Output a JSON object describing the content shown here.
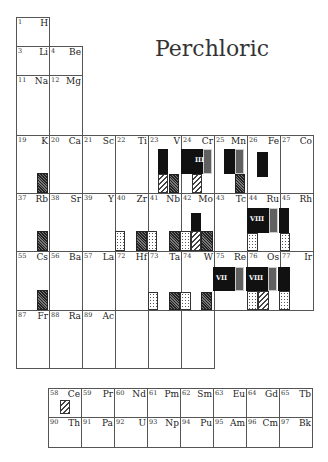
{
  "title": "Perchloric",
  "main_table": [
    {
      "n": "1",
      "s": "H"
    },
    {
      "n": "3",
      "s": "Li"
    },
    {
      "n": "4",
      "s": "Be"
    },
    {
      "n": "11",
      "s": "Na"
    },
    {
      "n": "12",
      "s": "Mg"
    },
    {
      "n": "19",
      "s": "K"
    },
    {
      "n": "20",
      "s": "Ca"
    },
    {
      "n": "21",
      "s": "Sc"
    },
    {
      "n": "22",
      "s": "Ti"
    },
    {
      "n": "23",
      "s": "V"
    },
    {
      "n": "24",
      "s": "Cr"
    },
    {
      "n": "25",
      "s": "Mn"
    },
    {
      "n": "26",
      "s": "Fe"
    },
    {
      "n": "27",
      "s": "Co"
    },
    {
      "n": "37",
      "s": "Rb"
    },
    {
      "n": "38",
      "s": "Sr"
    },
    {
      "n": "39",
      "s": "Y"
    },
    {
      "n": "40",
      "s": "Zr"
    },
    {
      "n": "41",
      "s": "Nb"
    },
    {
      "n": "42",
      "s": "Mo"
    },
    {
      "n": "43",
      "s": "Tc"
    },
    {
      "n": "44",
      "s": "Ru"
    },
    {
      "n": "45",
      "s": "Rh"
    },
    {
      "n": "55",
      "s": "Cs"
    },
    {
      "n": "56",
      "s": "Ba"
    },
    {
      "n": "57",
      "s": "La"
    },
    {
      "n": "72",
      "s": "Hf"
    },
    {
      "n": "73",
      "s": "Ta"
    },
    {
      "n": "74",
      "s": "W"
    },
    {
      "n": "75",
      "s": "Re"
    },
    {
      "n": "76",
      "s": "Os"
    },
    {
      "n": "77",
      "s": "Ir"
    },
    {
      "n": "87",
      "s": "Fr"
    },
    {
      "n": "88",
      "s": "Ra"
    },
    {
      "n": "89",
      "s": "Ac"
    },
    {
      "n": "",
      "s": ""
    },
    {
      "n": "",
      "s": ""
    },
    {
      "n": "",
      "s": ""
    }
  ],
  "lanthanides": [
    {
      "n": "58",
      "s": "Ce"
    },
    {
      "n": "59",
      "s": "Pr"
    },
    {
      "n": "60",
      "s": "Nd"
    },
    {
      "n": "61",
      "s": "Pm"
    },
    {
      "n": "62",
      "s": "Sm"
    },
    {
      "n": "63",
      "s": "Eu"
    },
    {
      "n": "64",
      "s": "Gd"
    },
    {
      "n": "65",
      "s": "Tb"
    }
  ],
  "actinides": [
    {
      "n": "90",
      "s": "Th"
    },
    {
      "n": "91",
      "s": "Pa"
    },
    {
      "n": "92",
      "s": "U"
    },
    {
      "n": "93",
      "s": "Np"
    },
    {
      "n": "94",
      "s": "Pu"
    },
    {
      "n": "95",
      "s": "Am"
    },
    {
      "n": "96",
      "s": "Cm"
    },
    {
      "n": "97",
      "s": "Bk"
    }
  ],
  "oxidation_labels": {
    "cr": "III",
    "ru": "VIII",
    "re": "VII",
    "os": "VIII"
  },
  "legend_patterns": [
    "solid",
    "dense-hatch",
    "dots",
    "diagonal-hatch",
    "gray-speckle"
  ]
}
